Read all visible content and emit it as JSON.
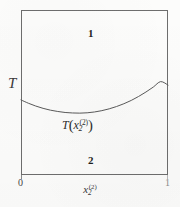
{
  "figure": {
    "type": "phase-diagram",
    "background_color": "#fdfdfc",
    "ink_color": "#2b2b2b",
    "frame_color": "#6e6e6e"
  },
  "axes": {
    "y_label": "T",
    "x_label_base": "x",
    "x_label_sub": "2",
    "x_label_sup": "(2)",
    "x_ticks": [
      "0",
      "1"
    ],
    "x_tick_left": "0",
    "x_tick_right": "1",
    "xlim": [
      0,
      1
    ],
    "y_ticks": []
  },
  "regions": {
    "upper_label": "1",
    "lower_label": "2"
  },
  "annotation": {
    "prefix": "T",
    "open_paren": "(",
    "var": "x",
    "sub": "2",
    "sup": "(2)",
    "close_paren": ")",
    "full_text": "T(x2^(2))"
  },
  "chart_data": {
    "type": "line",
    "title": "",
    "subtitle": "",
    "xlabel": "x_2^(2)",
    "ylabel": "T",
    "xlim": [
      0,
      1
    ],
    "ylim": [
      0,
      1
    ],
    "grid": false,
    "legend": null,
    "legend_position": "none",
    "x_tick_labels": [
      "0",
      "1"
    ],
    "x_tick_values": [
      0,
      1
    ],
    "y_tick_labels": [],
    "y_tick_values": [],
    "series": [
      {
        "name": "T(x_2^(2))",
        "type": "line",
        "color": "#5a5a5a",
        "x": [
          0.0,
          0.05,
          0.1,
          0.15,
          0.2,
          0.25,
          0.3,
          0.35,
          0.4,
          0.45,
          0.5,
          0.55,
          0.6,
          0.65,
          0.7,
          0.75,
          0.8,
          0.85,
          0.9,
          0.95,
          1.0
        ],
        "y": [
          0.455,
          0.435,
          0.418,
          0.404,
          0.393,
          0.385,
          0.379,
          0.376,
          0.375,
          0.377,
          0.382,
          0.39,
          0.401,
          0.415,
          0.432,
          0.452,
          0.476,
          0.503,
          0.533,
          0.566,
          0.545
        ]
      }
    ],
    "annotations": [
      {
        "text": "1",
        "x": 0.46,
        "y": 0.87,
        "bold": true,
        "role": "region-label"
      },
      {
        "text": "2",
        "x": 0.46,
        "y": 0.11,
        "bold": true,
        "role": "region-label"
      },
      {
        "text": "T(x_2^(2))",
        "x": 0.42,
        "y": 0.33,
        "bold": false,
        "role": "curve-label"
      }
    ]
  }
}
